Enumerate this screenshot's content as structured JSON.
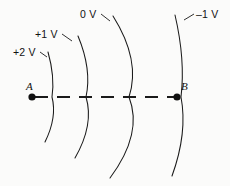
{
  "figure": {
    "background_color": "#fbfbfa",
    "stroke_color": "#1a1a1a",
    "equipotentials": [
      {
        "id": "plus-two-volts",
        "label": "+2 V",
        "label_x": 13,
        "label_y": 46,
        "arc_top_x": 48,
        "arc_top_y": 52,
        "arc_mid_x": 52,
        "arc_mid_y": 97,
        "arc_bottom_x": 45,
        "arc_bottom_y": 142,
        "leader_x1": 40,
        "leader_y1": 52,
        "leader_x2": 47,
        "leader_y2": 57
      },
      {
        "id": "plus-one-volt",
        "label": "+1 V",
        "label_x": 35,
        "label_y": 28,
        "arc_top_x": 78,
        "arc_top_y": 36,
        "arc_mid_x": 86,
        "arc_mid_y": 97,
        "arc_bottom_x": 75,
        "arc_bottom_y": 158,
        "leader_x1": 62,
        "leader_y1": 34,
        "leader_x2": 72,
        "leader_y2": 41
      },
      {
        "id": "zero-volts",
        "label": "0 V",
        "label_x": 80,
        "label_y": 8,
        "arc_top_x": 113,
        "arc_top_y": 16,
        "arc_mid_x": 129,
        "arc_mid_y": 97,
        "arc_bottom_x": 110,
        "arc_bottom_y": 178,
        "leader_x1": 101,
        "leader_y1": 14,
        "leader_x2": 110,
        "leader_y2": 21
      },
      {
        "id": "minus-one-volt",
        "label": "–1 V",
        "label_x": 196,
        "label_y": 8,
        "arc_top_x": 175,
        "arc_top_y": 15,
        "arc_mid_x": 181,
        "arc_mid_y": 97,
        "arc_bottom_x": 172,
        "arc_bottom_y": 176,
        "leader_x1": 194,
        "leader_y1": 14,
        "leader_x2": 184,
        "leader_y2": 20
      }
    ],
    "points": [
      {
        "id": "point-a",
        "label": "A",
        "dot_x": 32,
        "dot_y": 97,
        "dot_r": 3.6,
        "label_x": 26,
        "label_y": 80
      },
      {
        "id": "point-b",
        "label": "B",
        "dot_x": 177,
        "dot_y": 97,
        "dot_r": 3.6,
        "label_x": 181,
        "label_y": 80
      }
    ],
    "axis": {
      "id": "dashed-axis",
      "y": 97,
      "x_start": 35,
      "x_end": 175,
      "dash_pattern": "13 9",
      "stroke_width": 1.9
    }
  }
}
